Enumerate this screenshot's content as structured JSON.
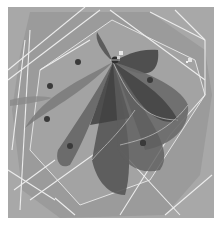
{
  "viewport": {
    "background": "#ffffff",
    "render_bg": "#a9a9a9",
    "plane_fill": "#9a9a9a",
    "plane_edge": "#e6e6e6",
    "petal_dark": "#4a4a4a",
    "petal_mid": "#6a6a6a",
    "petal_light": "#858585",
    "dot_color": "#3a3a3a",
    "line_color": "#ececec"
  },
  "scene": {
    "center": [
      113,
      60
    ],
    "dots": [
      [
        78,
        62
      ],
      [
        50,
        86
      ],
      [
        150,
        80
      ],
      [
        47,
        119
      ],
      [
        70,
        146
      ],
      [
        143,
        143
      ],
      [
        100,
        96
      ]
    ],
    "marker_small": [
      190,
      60
    ]
  }
}
